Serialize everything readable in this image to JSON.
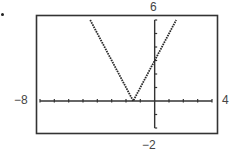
{
  "chart_data": {
    "type": "line",
    "title": "",
    "xlabel": "",
    "ylabel": "",
    "function": "y = |2x + 3|",
    "xlim": [
      -8,
      4
    ],
    "ylim": [
      -2,
      6
    ],
    "xscale": 1,
    "yscale": 1,
    "grid": false,
    "legend": null,
    "window_labels": {
      "xmin": "−8",
      "xmax": "4",
      "ymin": "−2",
      "ymax": "6"
    },
    "series": [
      {
        "name": "graph",
        "style": "dotted",
        "x": [
          -4.5,
          -3,
          -1.5,
          0,
          1.5
        ],
        "y": [
          6,
          3,
          0,
          3,
          6
        ]
      }
    ],
    "key_points": {
      "vertex": [
        -1.5,
        0
      ],
      "y_intercept": [
        0,
        3
      ]
    }
  }
}
